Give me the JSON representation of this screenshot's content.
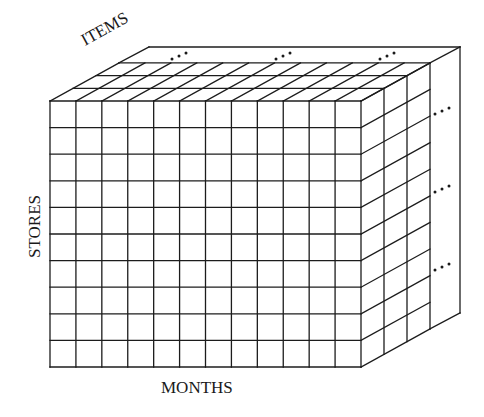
{
  "diagram": {
    "type": "data-cube",
    "colors": {
      "line": "#1c1c1c",
      "text": "#1a1a1a",
      "background": "#ffffff"
    },
    "labels": {
      "months": "MONTHS",
      "stores": "STORES",
      "items": "ITEMS"
    },
    "dimensions": {
      "front_columns": 12,
      "front_rows": 10,
      "depth_layers_drawn": 3
    },
    "geometry": {
      "front_left": 50,
      "front_top": 101,
      "front_right": 361,
      "front_bottom": 367,
      "layer_dx": 23,
      "layer_dy": -12.7,
      "back_dx": 99,
      "back_dy": -54
    },
    "ellipses": {
      "glyph": "…",
      "top": [
        [
          172,
          59
        ],
        [
          276,
          59
        ],
        [
          380,
          59
        ]
      ],
      "right": [
        [
          435,
          114
        ],
        [
          435,
          192
        ],
        [
          435,
          270
        ]
      ]
    }
  }
}
